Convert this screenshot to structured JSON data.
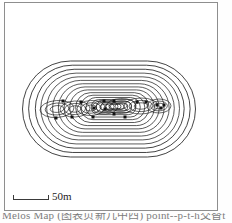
{
  "figure": {
    "kind": "contour-map",
    "frame": {
      "visible": true,
      "color": "#8e8e8e"
    },
    "background_color": "#ffffff"
  },
  "scalebar": {
    "label": "50m",
    "length_meters": 50,
    "color": "#3a3a3a"
  },
  "caption": {
    "text": "Melos Map (图表页新几中西)                 point--p-t-h交替t"
  },
  "chart_data": {
    "type": "contour",
    "title": "",
    "subtitle": "",
    "xlabel": "",
    "ylabel": "",
    "grid": false,
    "legend": "none",
    "annotations": [
      "50m"
    ],
    "shape": "stadium",
    "contour_color": "#1a1a1a",
    "contour_count": 17,
    "contour_levels": [
      1,
      2,
      3,
      4,
      5,
      6,
      7,
      8,
      9,
      10,
      11,
      12,
      13,
      14,
      15,
      16,
      17
    ],
    "outermost_extent": {
      "x": [
        22,
        195
      ],
      "y": [
        62,
        158
      ]
    },
    "center": {
      "x": 108,
      "y": 108
    },
    "marker_shape": "square",
    "marker_color": "#111111",
    "marker_size_px": 3,
    "markers": [
      {
        "x": 62,
        "y": 100
      },
      {
        "x": 55,
        "y": 117
      },
      {
        "x": 71,
        "y": 116
      },
      {
        "x": 80,
        "y": 101
      },
      {
        "x": 103,
        "y": 100
      },
      {
        "x": 104,
        "y": 108
      },
      {
        "x": 113,
        "y": 113
      },
      {
        "x": 93,
        "y": 107
      },
      {
        "x": 92,
        "y": 116
      },
      {
        "x": 113,
        "y": 100
      },
      {
        "x": 124,
        "y": 116
      },
      {
        "x": 136,
        "y": 101
      },
      {
        "x": 145,
        "y": 101
      },
      {
        "x": 156,
        "y": 104
      },
      {
        "x": 160,
        "y": 107
      },
      {
        "x": 163,
        "y": 104
      }
    ]
  }
}
